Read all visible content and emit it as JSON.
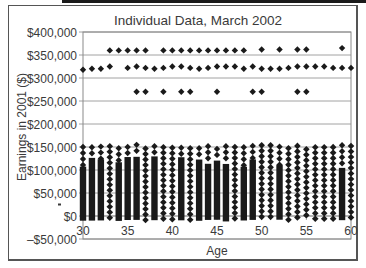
{
  "chart_data": {
    "type": "scatter",
    "title": "Individual Data, March 2002",
    "xlabel": "Age",
    "ylabel": "Earnings in 2001 ($)",
    "xlim": [
      30,
      60
    ],
    "ylim": [
      -50000,
      400000
    ],
    "x_ticks": [
      30,
      35,
      40,
      45,
      50,
      55,
      60
    ],
    "x_tick_labels": [
      "30",
      "35",
      "40",
      "45",
      "50",
      "55",
      "60"
    ],
    "y_ticks": [
      400000,
      350000,
      300000,
      250000,
      200000,
      150000,
      100000,
      50000,
      0,
      -50000
    ],
    "y_tick_labels": [
      "$400,000",
      "$350,000",
      "$300,000",
      "$250,000",
      "$200,000",
      "$150,000",
      "$100,000",
      "$50,000",
      "$0",
      "–$50,000"
    ],
    "grid": "horizontal",
    "legend": "none",
    "marker": "diamond",
    "series": [
      {
        "name": "Top-coded ~$360,000",
        "x": [
          33,
          34,
          35,
          36,
          37,
          39,
          40,
          41,
          42,
          43,
          44,
          45,
          46,
          47,
          48,
          50,
          52,
          54,
          55,
          59
        ],
        "y": [
          360000,
          360000,
          360000,
          360000,
          360000,
          360000,
          360000,
          360000,
          360000,
          360000,
          360000,
          360000,
          360000,
          360000,
          360000,
          362000,
          362000,
          362000,
          362000,
          365000
        ]
      },
      {
        "name": "Top-coded ~$320,000",
        "x": [
          30,
          31,
          32,
          33,
          35,
          36,
          37,
          38,
          39,
          40,
          41,
          42,
          43,
          44,
          45,
          46,
          47,
          48,
          49,
          50,
          51,
          52,
          53,
          54,
          55,
          56,
          57,
          58,
          59,
          60
        ],
        "y": [
          318000,
          320000,
          320000,
          325000,
          322000,
          325000,
          322000,
          320000,
          322000,
          325000,
          325000,
          322000,
          320000,
          322000,
          325000,
          325000,
          325000,
          320000,
          325000,
          320000,
          320000,
          320000,
          322000,
          325000,
          325000,
          325000,
          325000,
          322000,
          322000,
          322000
        ]
      },
      {
        "name": "Top-coded ~$270,000",
        "x": [
          36,
          37,
          39,
          41,
          42,
          45,
          49,
          50,
          54,
          55
        ],
        "y": [
          270000,
          270000,
          270000,
          270000,
          270000,
          270000,
          270000,
          270000,
          270000,
          270000
        ]
      },
      {
        "name": "Dense individual observations",
        "x_range": [
          30,
          60
        ],
        "y_range": [
          -10000,
          155000
        ],
        "note": "Dense vertical columns of observations at every integer age from 30 to 60, spanning roughly $0 to $150,000"
      }
    ]
  }
}
